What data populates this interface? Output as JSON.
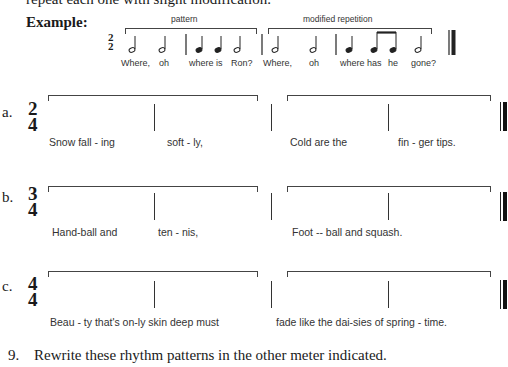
{
  "intro_text": "repeat each one with slight modification.",
  "example": {
    "label": "Example:",
    "time_signature": {
      "top": "2",
      "bottom": "2"
    },
    "pattern_label": "pattern",
    "repetition_label": "modified repetition",
    "lyrics": [
      "Where,",
      "oh",
      "where is",
      "Ron?",
      "Where,",
      "oh",
      "where has",
      "he",
      "gone?"
    ],
    "notes": [
      "half",
      "half",
      "bar",
      "quarter",
      "quarter",
      "half",
      "bar",
      "half",
      "half",
      "bar",
      "quarter",
      "eighth",
      "eighth",
      "half",
      "final-bar"
    ]
  },
  "exercises": [
    {
      "letter": "a.",
      "time_signature": {
        "top": "2",
        "bottom": "4"
      },
      "lyrics": [
        "Snow fall - ing",
        "soft - ly,",
        "Cold  are  the",
        "fin - ger  tips."
      ]
    },
    {
      "letter": "b.",
      "time_signature": {
        "top": "3",
        "bottom": "4"
      },
      "lyrics": [
        "Hand-ball    and",
        "ten  -  nis,",
        "Foot -- ball  and  squash."
      ]
    },
    {
      "letter": "c.",
      "time_signature": {
        "top": "4",
        "bottom": "4"
      },
      "lyrics": [
        "Beau - ty that's on-ly  skin   deep    must",
        "fade like the dai-sies of spring - time."
      ]
    }
  ],
  "question_9": {
    "number": "9.",
    "text": "Rewrite these rhythm patterns in the other meter indicated."
  }
}
